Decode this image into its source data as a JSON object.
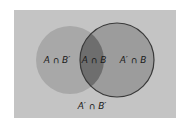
{
  "diagram": {
    "type": "venn",
    "regions": {
      "a_only": "A ∩ B′",
      "intersection": "A ∩ B",
      "b_only": "A′ ∩ B",
      "outside": "A′ ∩ B′"
    },
    "colors": {
      "background": "#c4c4c4",
      "circle_a": "#a8a8a8",
      "circle_b": "#9c9c9c",
      "intersection": "#6e6e6e",
      "outline": "#3a3a3a"
    }
  }
}
